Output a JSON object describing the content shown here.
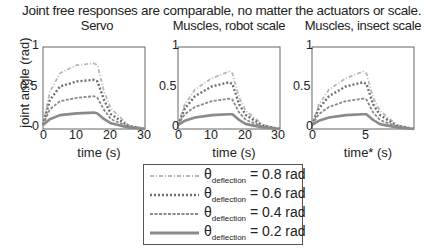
{
  "header": {
    "title": "Joint free responses are comparable, no matter the actuators or scale."
  },
  "ylabel": "joint angle (rad)",
  "panels": [
    {
      "title": "Servo",
      "xlabel": "time (s)",
      "xticks": [
        "0",
        "10",
        "20",
        "30"
      ],
      "yticks": [
        "0",
        "0.5",
        "1"
      ]
    },
    {
      "title": "Muscles, robot scale",
      "xlabel": "time (s)",
      "xticks": [
        "0",
        "10",
        "20",
        "30"
      ],
      "yticks": [
        "0",
        "0.5",
        "1"
      ]
    },
    {
      "title": "Muscles, insect scale",
      "xlabel": "time* (s)",
      "xticks": [
        "0",
        "5"
      ],
      "yticks": [
        "0",
        "0.5",
        "1"
      ]
    }
  ],
  "legend": {
    "symbol": "θ",
    "subscript": "deflection",
    "entries": [
      {
        "label": "= 0.8 rad",
        "style": "dash-dot-light",
        "color": "#b0b0b0"
      },
      {
        "label": "= 0.6 rad",
        "style": "dotted",
        "color": "#707070"
      },
      {
        "label": "= 0.4 rad",
        "style": "dashed",
        "color": "#888888"
      },
      {
        "label": "= 0.2 rad",
        "style": "solid",
        "color": "#888888"
      }
    ]
  },
  "chart_data": [
    {
      "type": "line",
      "title": "Servo",
      "xlabel": "time (s)",
      "ylabel": "joint angle (rad)",
      "xlim": [
        0,
        30
      ],
      "ylim": [
        0,
        1
      ],
      "x": [
        0,
        2,
        5,
        10,
        15,
        16,
        18,
        20,
        25,
        30
      ],
      "series": [
        {
          "name": "θdeflection = 0.8 rad",
          "values": [
            0.05,
            0.45,
            0.68,
            0.78,
            0.8,
            0.78,
            0.45,
            0.25,
            0.05,
            0.0
          ]
        },
        {
          "name": "θdeflection = 0.6 rad",
          "values": [
            0.05,
            0.35,
            0.52,
            0.58,
            0.6,
            0.58,
            0.35,
            0.18,
            0.04,
            0.0
          ]
        },
        {
          "name": "θdeflection = 0.4 rad",
          "values": [
            0.05,
            0.24,
            0.34,
            0.38,
            0.4,
            0.38,
            0.23,
            0.12,
            0.03,
            0.0
          ]
        },
        {
          "name": "θdeflection = 0.2 rad",
          "values": [
            0.05,
            0.12,
            0.17,
            0.19,
            0.2,
            0.19,
            0.12,
            0.07,
            0.02,
            0.0
          ]
        }
      ],
      "legend_position": "below"
    },
    {
      "type": "line",
      "title": "Muscles, robot scale",
      "xlabel": "time (s)",
      "ylabel": "",
      "xlim": [
        0,
        30
      ],
      "ylim": [
        0,
        1
      ],
      "x": [
        0,
        2,
        5,
        10,
        15,
        16,
        18,
        20,
        25,
        30
      ],
      "series": [
        {
          "name": "θdeflection = 0.8 rad",
          "values": [
            0.05,
            0.3,
            0.48,
            0.62,
            0.7,
            0.68,
            0.38,
            0.22,
            0.05,
            0.0
          ]
        },
        {
          "name": "θdeflection = 0.6 rad",
          "values": [
            0.05,
            0.25,
            0.4,
            0.52,
            0.57,
            0.55,
            0.3,
            0.17,
            0.04,
            0.0
          ]
        },
        {
          "name": "θdeflection = 0.4 rad",
          "values": [
            0.05,
            0.18,
            0.27,
            0.34,
            0.37,
            0.36,
            0.2,
            0.11,
            0.03,
            0.0
          ]
        },
        {
          "name": "θdeflection = 0.2 rad",
          "values": [
            0.05,
            0.1,
            0.14,
            0.17,
            0.18,
            0.18,
            0.11,
            0.06,
            0.02,
            0.0
          ]
        }
      ]
    },
    {
      "type": "line",
      "title": "Muscles, insect scale",
      "xlabel": "time* (s)",
      "ylabel": "",
      "xlim": [
        0,
        9
      ],
      "ylim": [
        0,
        1
      ],
      "x": [
        0,
        0.6,
        1.5,
        3,
        4.5,
        4.8,
        5.4,
        6,
        7.5,
        9
      ],
      "series": [
        {
          "name": "θdeflection = 0.8 rad",
          "values": [
            0.05,
            0.3,
            0.48,
            0.62,
            0.7,
            0.68,
            0.38,
            0.22,
            0.05,
            0.0
          ]
        },
        {
          "name": "θdeflection = 0.6 rad",
          "values": [
            0.05,
            0.25,
            0.4,
            0.52,
            0.57,
            0.55,
            0.3,
            0.17,
            0.04,
            0.0
          ]
        },
        {
          "name": "θdeflection = 0.4 rad",
          "values": [
            0.05,
            0.18,
            0.27,
            0.34,
            0.37,
            0.36,
            0.2,
            0.11,
            0.03,
            0.0
          ]
        },
        {
          "name": "θdeflection = 0.2 rad",
          "values": [
            0.05,
            0.1,
            0.14,
            0.17,
            0.18,
            0.18,
            0.11,
            0.06,
            0.02,
            0.0
          ]
        }
      ]
    }
  ]
}
